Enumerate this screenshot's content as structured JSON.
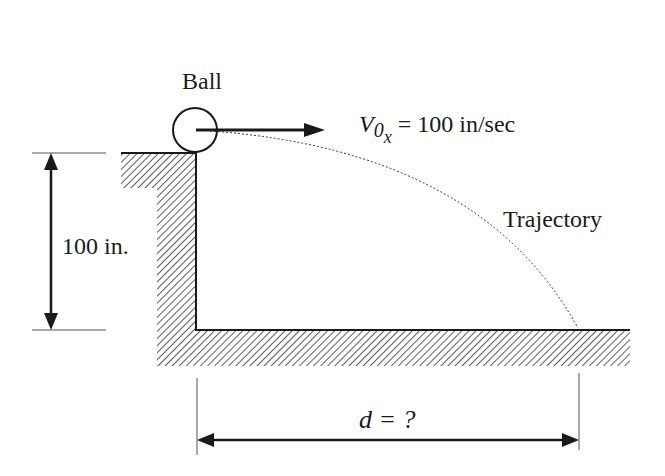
{
  "diagram": {
    "labels": {
      "ball": "Ball",
      "velocity_symbol": "V",
      "velocity_subscript": "0",
      "velocity_subsub": "x",
      "velocity_value": "= 100 in/sec",
      "height": "100 in.",
      "trajectory": "Trajectory",
      "distance": "d = ?"
    },
    "values": {
      "initial_velocity_x": 100,
      "velocity_unit": "in/sec",
      "height": 100,
      "height_unit": "in.",
      "distance": "?"
    },
    "colors": {
      "line": "#1a1a1a",
      "hatch": "#333333",
      "background": "#ffffff"
    }
  }
}
